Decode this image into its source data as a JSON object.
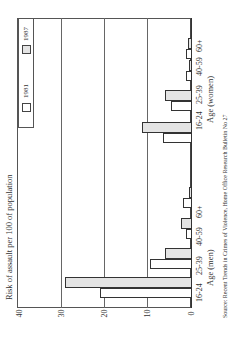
{
  "chart_data": {
    "type": "bar",
    "orientation": "rotated 90deg (horizontal bars extending left from baseline)",
    "title": "",
    "ylabel": "Risk of assault per 100 of population",
    "xlabel_groups": [
      "Age (men)",
      "Age (women)"
    ],
    "categories": [
      "16-24",
      "25-39",
      "40-59",
      "60+"
    ],
    "groups": [
      {
        "name": "Age (men)",
        "series": [
          {
            "name": "1981",
            "values": [
              21,
              9.5,
              1.3,
              1.9
            ]
          },
          {
            "name": "1987",
            "values": [
              29,
              6,
              2.4,
              0.5
            ]
          }
        ]
      },
      {
        "name": "Age (women)",
        "series": [
          {
            "name": "1981",
            "values": [
              6.5,
              4.7,
              1.3,
              1.3
            ]
          },
          {
            "name": "1987",
            "values": [
              11.4,
              6.2,
              0.5,
              0.8
            ]
          }
        ]
      }
    ],
    "ylim": [
      0,
      40
    ],
    "yticks": [
      "0",
      "10",
      "20",
      "30",
      "40"
    ],
    "grid": true,
    "legend": {
      "position": "top-left (rotated)",
      "entries": [
        {
          "label": "1981",
          "color": "#ffffff"
        },
        {
          "label": "1987",
          "color": "#e4e4e4"
        }
      ]
    },
    "source": "Source: Recent Trends in Crimes of Violence, Home Office Research Bulletin No 27"
  },
  "labels": {
    "ytitle": "Risk of assault per 100 of population",
    "men": "Age (men)",
    "women": "Age (women)",
    "source": "Source: Recent Trends in Crimes of Violence, Home Office Research Bulletin No 27",
    "cat0": "16-24",
    "cat1": "25-39",
    "cat2": "40-59",
    "cat3": "60+",
    "t0": "0",
    "t10": "10",
    "t20": "20",
    "t30": "30",
    "t40": "40",
    "leg1981": "1981",
    "leg1987": "1987"
  },
  "colors": {
    "y1981": "#ffffff",
    "y1987": "#e4e4e4"
  }
}
